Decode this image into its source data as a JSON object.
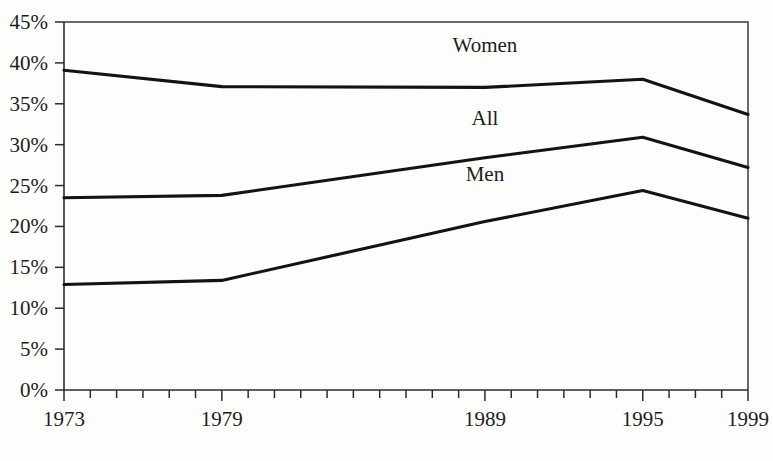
{
  "chart_data": {
    "type": "line",
    "title": "",
    "subtitle": "",
    "xlabel": "",
    "ylabel": "",
    "x": [
      1973,
      1974,
      1975,
      1976,
      1977,
      1978,
      1979,
      1980,
      1981,
      1982,
      1983,
      1984,
      1985,
      1986,
      1987,
      1988,
      1989,
      1990,
      1991,
      1992,
      1993,
      1994,
      1995,
      1996,
      1997,
      1998,
      1999
    ],
    "xlim": [
      1973,
      1999
    ],
    "ylim": [
      0,
      45
    ],
    "grid": false,
    "legend_position": "inline-above-line",
    "x_tick_values": [
      1973,
      1974,
      1975,
      1976,
      1977,
      1978,
      1979,
      1980,
      1981,
      1982,
      1983,
      1984,
      1985,
      1986,
      1987,
      1988,
      1989,
      1990,
      1991,
      1992,
      1993,
      1994,
      1995,
      1996,
      1997,
      1998,
      1999
    ],
    "x_tick_labels": [
      "1973",
      "",
      "",
      "",
      "",
      "",
      "1979",
      "",
      "",
      "",
      "",
      "",
      "",
      "",
      "",
      "",
      "1989",
      "",
      "",
      "",
      "",
      "",
      "1995",
      "",
      "",
      "",
      "1999"
    ],
    "y_tick_values": [
      0,
      5,
      10,
      15,
      20,
      25,
      30,
      35,
      40,
      45
    ],
    "y_tick_labels": [
      "0%",
      "5%",
      "10%",
      "15%",
      "20%",
      "25%",
      "30%",
      "35%",
      "40%",
      "45%"
    ],
    "series": [
      {
        "name": "Women",
        "label": "Women",
        "color": "#131313",
        "breakpoints_x": [
          1973,
          1979,
          1989,
          1995,
          1999
        ],
        "breakpoints_y": [
          39.1,
          37.1,
          37.0,
          38.0,
          33.7
        ]
      },
      {
        "name": "All",
        "label": "All",
        "color": "#131313",
        "breakpoints_x": [
          1973,
          1979,
          1989,
          1995,
          1999
        ],
        "breakpoints_y": [
          23.5,
          23.8,
          28.4,
          30.9,
          27.2
        ]
      },
      {
        "name": "Men",
        "label": "Men",
        "color": "#131313",
        "breakpoints_x": [
          1973,
          1979,
          1989,
          1995,
          1999
        ],
        "breakpoints_y": [
          12.9,
          13.4,
          20.6,
          24.4,
          21.0
        ]
      }
    ],
    "series_label_positions": [
      {
        "name": "Women",
        "x": 1989,
        "y": 41.3
      },
      {
        "name": "All",
        "x": 1989,
        "y": 32.4
      },
      {
        "name": "Men",
        "x": 1989,
        "y": 25.6
      }
    ]
  }
}
